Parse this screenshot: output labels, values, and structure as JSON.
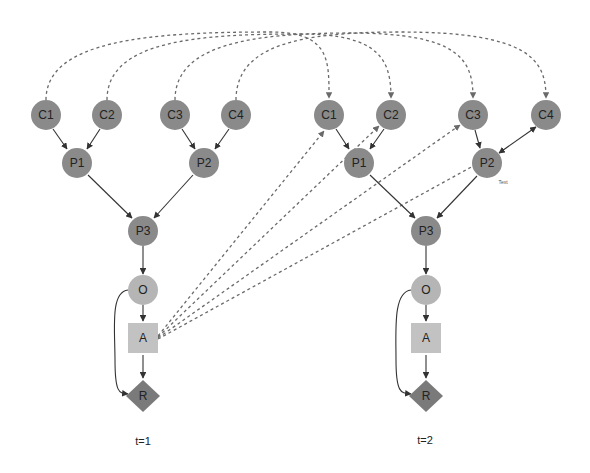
{
  "diagram": {
    "type": "influence-diagram-unrolled",
    "colors": {
      "chance_node": "#8a8a8a",
      "observation_node": "#b5b5b5",
      "action_node": "#c2c2c2",
      "reward_node": "#7a7a7a",
      "edge": "#333333",
      "temporal_edge": "#6a6a6a",
      "background": "#ffffff"
    },
    "slices": [
      {
        "label": "t=1",
        "nodes": {
          "C1": "C1",
          "C2": "C2",
          "C3": "C3",
          "C4": "C4",
          "P1": "P1",
          "P2": "P2",
          "P3": "P3",
          "O": "O",
          "A": "A",
          "R": "R"
        }
      },
      {
        "label": "t=2",
        "nodes": {
          "C1": "C1",
          "C2": "C2",
          "C3": "C3",
          "C4": "C4",
          "P1": "P1",
          "P2": "P2",
          "P3": "P3",
          "O": "O",
          "A": "A",
          "R": "R"
        },
        "annotation": "Text"
      }
    ],
    "edges": [
      {
        "from": "C1",
        "to": "P1",
        "style": "solid"
      },
      {
        "from": "C2",
        "to": "P1",
        "style": "solid"
      },
      {
        "from": "C3",
        "to": "P2",
        "style": "solid"
      },
      {
        "from": "C4",
        "to": "P2",
        "style": "solid"
      },
      {
        "from": "P1",
        "to": "P3",
        "style": "solid"
      },
      {
        "from": "P2",
        "to": "P3",
        "style": "solid"
      },
      {
        "from": "P3",
        "to": "O",
        "style": "solid"
      },
      {
        "from": "O",
        "to": "A",
        "style": "solid"
      },
      {
        "from": "A",
        "to": "R",
        "style": "solid"
      },
      {
        "from": "O",
        "to": "R",
        "style": "solid-curved"
      }
    ],
    "temporal_edges": [
      {
        "from": "t1.C1",
        "to": "t2.C1",
        "style": "dashed"
      },
      {
        "from": "t1.C2",
        "to": "t2.C2",
        "style": "dashed"
      },
      {
        "from": "t1.C3",
        "to": "t2.C3",
        "style": "dashed"
      },
      {
        "from": "t1.C4",
        "to": "t2.C4",
        "style": "dashed"
      },
      {
        "from": "t1.A",
        "to": "t2.C1",
        "style": "dashed"
      },
      {
        "from": "t1.A",
        "to": "t2.C2",
        "style": "dashed"
      },
      {
        "from": "t1.A",
        "to": "t2.C3",
        "style": "dashed"
      },
      {
        "from": "t1.A",
        "to": "t2.C4",
        "style": "dashed"
      }
    ]
  }
}
